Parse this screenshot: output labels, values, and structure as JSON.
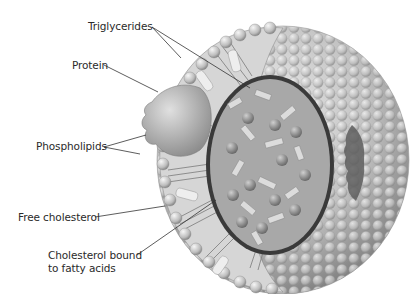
{
  "diagram": {
    "labels": {
      "triglycerides": "Triglycerides",
      "protein": "Protein",
      "phospholipids": "Phospholipids",
      "free_cholesterol": "Free cholesterol",
      "cholesterol_bound_line1": "Cholesterol bound",
      "cholesterol_bound_line2": "to fatty acids"
    },
    "colors": {
      "background": "#ffffff",
      "sphere_light": "#e8e8e8",
      "sphere_mid": "#b4b4b4",
      "sphere_dark": "#6e6e6e",
      "core_dark": "#2a2a2a",
      "leader_line": "#333333",
      "label_text": "#2a2a2a"
    }
  }
}
